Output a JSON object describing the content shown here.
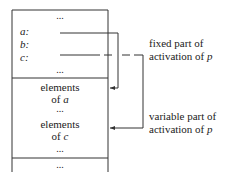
{
  "diagram": {
    "upper_section": {
      "top_ellipsis": "...",
      "fields": [
        {
          "label": "a:",
          "has_pointer": true
        },
        {
          "label": "b:",
          "has_pointer": false
        },
        {
          "label": "c:",
          "has_pointer": true
        }
      ],
      "bottom_ellipsis": "..."
    },
    "lower_section": {
      "entries": [
        {
          "line1": "elements",
          "line2_prefix": "of ",
          "line2_var": "a"
        },
        {
          "ellipsis": "..."
        },
        {
          "line1": "elements",
          "line2_prefix": "of ",
          "line2_var": "c"
        },
        {
          "ellipsis": "..."
        }
      ]
    },
    "trailing_ellipsis": "...",
    "annotations": {
      "fixed": {
        "line1": "fixed part of",
        "line2_prefix": "activation of ",
        "line2_var": "p"
      },
      "variable": {
        "line1": "variable part of",
        "line2_prefix": "activation of ",
        "line2_var": "p"
      }
    },
    "colors": {
      "line": "#333333",
      "text": "#222222",
      "background": "#ffffff"
    }
  }
}
